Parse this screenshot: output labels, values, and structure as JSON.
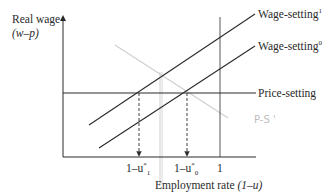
{
  "axes": {
    "y_label": "Real wage",
    "y_unit": "(w–p)",
    "x_label": "Employment rate",
    "x_unit": "(1–u)"
  },
  "curves": {
    "wage_setting_1": {
      "label": "Wage-setting",
      "sup": "1"
    },
    "wage_setting_0": {
      "label": "Wage-setting",
      "sup": "0"
    },
    "price_setting": {
      "label": "Price-setting"
    }
  },
  "ticks": {
    "u1": {
      "prefix": "1–u",
      "sub": "1",
      "sup": "*"
    },
    "u0": {
      "prefix": "1–u",
      "sub": "0",
      "sup": "*"
    },
    "one": "1"
  },
  "annotation": {
    "handwritten": "P-S '"
  },
  "colors": {
    "ink": "#2a2a2a",
    "pencil": "#c8c8c8"
  }
}
